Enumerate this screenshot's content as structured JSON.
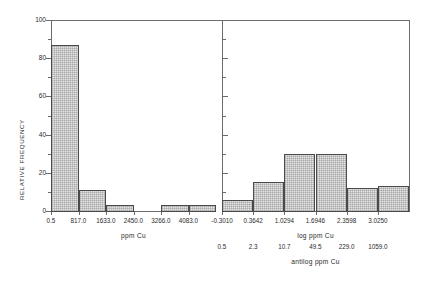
{
  "figure": {
    "background": "#ffffff",
    "line_color": "#6b6b6b",
    "bar_fill": "#ebebeb",
    "bar_edge": "#4a4a4a",
    "y_axis_label": "RELATIVE FREQUENCY",
    "y_ticks": [
      "0",
      "20",
      "40",
      "60",
      "80",
      "100"
    ],
    "y_tick_values": [
      0,
      20,
      40,
      60,
      80,
      100
    ],
    "y_minor_ticks": [
      10,
      30,
      50,
      70,
      90
    ]
  },
  "chart_data": [
    {
      "type": "bar",
      "panel": "left",
      "title": "",
      "xlabel": "ppm Cu",
      "ylabel": "RELATIVE FREQUENCY",
      "categories": [
        "0.5",
        "817.0",
        "1633.0",
        "2450.0",
        "3266.0",
        "4083.0"
      ],
      "tick_labels": [
        "0.5",
        "817.0",
        "1633.0",
        "2450.0",
        "3266.0",
        "4083.0"
      ],
      "bin_edges": [
        0.5,
        817.0,
        1633.0,
        2450.0,
        3266.0,
        4083.0,
        4899.5
      ],
      "values": [
        87,
        11,
        3,
        0,
        3,
        3
      ],
      "ylim": [
        0,
        100
      ],
      "xlim": [
        0.5,
        4899.5
      ],
      "grid": false,
      "legend": null
    },
    {
      "type": "bar",
      "panel": "right",
      "title": "",
      "xlabel": "log ppm Cu",
      "xlabel_secondary": "antilog ppm Cu",
      "ylabel": "RELATIVE FREQUENCY",
      "categories": [
        "-0.3010",
        "0.3642",
        "1.0294",
        "1.6946",
        "2.3598",
        "3.0250"
      ],
      "tick_labels": [
        "-0.3010",
        "0.3642",
        "1.0294",
        "1.6946",
        "2.3598",
        "3.0250"
      ],
      "tick_labels_antilog": [
        "0.5",
        "2.3",
        "10.7",
        "49.5",
        "229.0",
        "1059.0"
      ],
      "bin_edges": [
        -0.301,
        0.3642,
        1.0294,
        1.6946,
        2.3598,
        3.025,
        3.6902
      ],
      "values": [
        6,
        15,
        30,
        30,
        12,
        13
      ],
      "ylim": [
        0,
        100
      ],
      "xlim": [
        -0.301,
        3.6902
      ],
      "grid": false,
      "legend": null
    }
  ],
  "left_panel": {
    "x_title": "ppm Cu",
    "ticks": [
      {
        "label": "0.5"
      },
      {
        "label": "817.0"
      },
      {
        "label": "1633.0"
      },
      {
        "label": "2450.0"
      },
      {
        "label": "3266.0"
      },
      {
        "label": "4083.0"
      }
    ],
    "bars": [
      {
        "value": "87"
      },
      {
        "value": "11"
      },
      {
        "value": "3"
      },
      {
        "value": "0"
      },
      {
        "value": "3"
      },
      {
        "value": "3"
      }
    ]
  },
  "right_panel": {
    "x_title": "log ppm Cu",
    "x_title_secondary": "antilog ppm Cu",
    "ticks": [
      {
        "label": "-0.3010",
        "antilog": "0.5"
      },
      {
        "label": "0.3642",
        "antilog": "2.3"
      },
      {
        "label": "1.0294",
        "antilog": "10.7"
      },
      {
        "label": "1.6946",
        "antilog": "49.5"
      },
      {
        "label": "2.3598",
        "antilog": "229.0"
      },
      {
        "label": "3.0250",
        "antilog": "1059.0"
      }
    ],
    "bars": [
      {
        "value": "6"
      },
      {
        "value": "15"
      },
      {
        "value": "30"
      },
      {
        "value": "30"
      },
      {
        "value": "12"
      },
      {
        "value": "13"
      }
    ]
  }
}
